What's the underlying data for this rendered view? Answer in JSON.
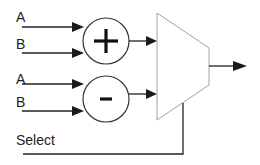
{
  "diagram": {
    "inputs": {
      "adder_a": "A",
      "adder_b": "B",
      "subtractor_a": "A",
      "subtractor_b": "B",
      "select": "Select"
    },
    "operators": {
      "adder_symbol": "+",
      "subtractor_symbol": "-"
    },
    "blocks": [
      {
        "id": "adder",
        "type": "circle",
        "symbol": "+"
      },
      {
        "id": "subtractor",
        "type": "circle",
        "symbol": "-"
      },
      {
        "id": "mux",
        "type": "trapezoid",
        "inputs": 2,
        "outputs": 1,
        "control": "Select"
      }
    ],
    "connections": [
      {
        "from": "A",
        "to": "adder"
      },
      {
        "from": "B",
        "to": "adder"
      },
      {
        "from": "A",
        "to": "subtractor"
      },
      {
        "from": "B",
        "to": "subtractor"
      },
      {
        "from": "adder",
        "to": "mux.in0"
      },
      {
        "from": "subtractor",
        "to": "mux.in1"
      },
      {
        "from": "Select",
        "to": "mux.control"
      },
      {
        "from": "mux",
        "to": "output"
      }
    ],
    "colors": {
      "line": "#222222",
      "mux_outline": "#a0a0a0",
      "background": "#ffffff"
    }
  }
}
